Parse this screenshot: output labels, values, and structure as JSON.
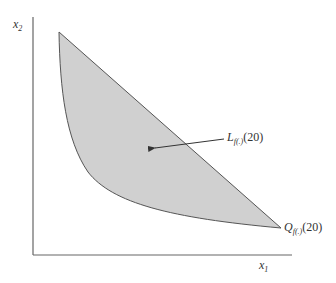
{
  "diagram": {
    "axes": {
      "y_label": "x",
      "y_label_sub": "2",
      "x_label": "x",
      "x_label_sub": "1"
    },
    "region": {
      "label_main": "L",
      "label_sub": "f(.)",
      "label_arg": "(20)",
      "fill_color": "#d0d0d0",
      "stroke_color": "#555555"
    },
    "isoquant": {
      "label_main": "Q",
      "label_sub": "f(.)",
      "label_arg": "(20)"
    },
    "colors": {
      "axis": "#666666",
      "text": "#333333"
    }
  }
}
